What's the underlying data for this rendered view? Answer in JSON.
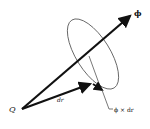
{
  "diagram": {
    "title": "",
    "labels": {
      "origin": "Q",
      "displacement": "dr",
      "axis": "ϕ",
      "cross_product": "ϕ × dr"
    },
    "colors": {
      "stroke": "#111111",
      "ellipse": "#555555",
      "background": "#ffffff"
    }
  }
}
